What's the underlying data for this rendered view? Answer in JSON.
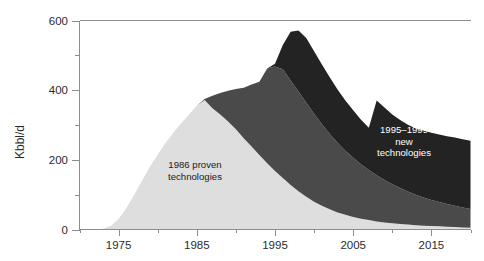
{
  "chart_data": {
    "type": "area",
    "stacked": true,
    "title": "",
    "subtitle": "",
    "xlabel": "",
    "ylabel": "Kbbl/d",
    "xlim": [
      1970,
      2020
    ],
    "ylim": [
      0,
      600
    ],
    "grid": false,
    "legend_position": "inline-annotations",
    "x_major_ticks": [
      1975,
      1985,
      1995,
      2005,
      2015
    ],
    "x_minor_ticks": [
      1970,
      1980,
      1990,
      2000,
      2010,
      2020
    ],
    "x_tick_labels": [
      "1975",
      "1985",
      "1995",
      "2005",
      "2015"
    ],
    "y_major_ticks": [
      0,
      200,
      400,
      600
    ],
    "y_minor_ticks": [
      100,
      300,
      500
    ],
    "y_tick_labels": [
      "0",
      "200",
      "400",
      "600"
    ],
    "x": [
      1970,
      1971,
      1972,
      1973,
      1974,
      1975,
      1976,
      1977,
      1978,
      1979,
      1980,
      1981,
      1982,
      1983,
      1984,
      1985,
      1986,
      1987,
      1988,
      1989,
      1990,
      1991,
      1992,
      1993,
      1994,
      1995,
      1996,
      1997,
      1998,
      1999,
      2000,
      2001,
      2002,
      2003,
      2004,
      2005,
      2006,
      2007,
      2008,
      2009,
      2010,
      2011,
      2012,
      2013,
      2014,
      2015,
      2016,
      2017,
      2018,
      2019,
      2020
    ],
    "series": [
      {
        "name": "1986 proven technologies",
        "color": "#dedede",
        "values": [
          0,
          0,
          0,
          2,
          10,
          30,
          62,
          100,
          140,
          180,
          215,
          248,
          278,
          305,
          330,
          355,
          372,
          348,
          330,
          310,
          288,
          262,
          238,
          214,
          190,
          168,
          148,
          128,
          110,
          94,
          80,
          68,
          58,
          49,
          42,
          36,
          31,
          27,
          23,
          20,
          18,
          16,
          14,
          12,
          11,
          10,
          9,
          8,
          7,
          6,
          5
        ]
      },
      {
        "name": "1986-1994 technologies",
        "color": "#4a4a4a",
        "values": [
          0,
          0,
          0,
          0,
          0,
          0,
          0,
          0,
          0,
          0,
          0,
          0,
          0,
          0,
          0,
          0,
          3,
          36,
          62,
          88,
          115,
          145,
          178,
          210,
          272,
          300,
          312,
          300,
          286,
          270,
          252,
          234,
          216,
          200,
          184,
          170,
          156,
          144,
          133,
          122,
          112,
          103,
          95,
          88,
          81,
          75,
          70,
          65,
          61,
          57,
          54
        ]
      },
      {
        "name": "1995-1999 new technologies",
        "color": "#232323",
        "values": [
          0,
          0,
          0,
          0,
          0,
          0,
          0,
          0,
          0,
          0,
          0,
          0,
          0,
          0,
          0,
          0,
          0,
          0,
          0,
          0,
          0,
          0,
          0,
          0,
          0,
          8,
          70,
          140,
          175,
          186,
          180,
          172,
          163,
          153,
          144,
          136,
          128,
          121,
          214,
          208,
          200,
          195,
          192,
          190,
          192,
          193,
          194,
          195,
          196,
          196,
          196
        ]
      }
    ],
    "annotations": [
      {
        "name": "annotation-proven",
        "lines": [
          "1986 proven",
          "technologies"
        ],
        "x_px": 195,
        "y_px": 168,
        "color": "#1a1a1a",
        "anchor": "middle"
      },
      {
        "name": "annotation-new-tech",
        "lines": [
          "1995–1999",
          "new",
          "technologies"
        ],
        "x_px": 404,
        "y_px": 133,
        "color": "#ffffff",
        "anchor": "middle"
      }
    ]
  },
  "axes": {
    "y_axis_title": "Kbbl/d",
    "axis_color": "#8d8d8d"
  }
}
